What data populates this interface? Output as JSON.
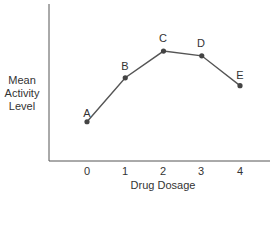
{
  "chart_data": {
    "type": "line",
    "title": "",
    "xlabel": "Drug Dosage",
    "ylabel": "Mean Activity Level",
    "ylabel_lines": [
      "Mean",
      "Activity",
      "Level"
    ],
    "x": [
      0,
      1,
      2,
      3,
      4
    ],
    "categories": [
      "0",
      "1",
      "2",
      "3",
      "4"
    ],
    "point_labels": [
      "A",
      "B",
      "C",
      "D",
      "E"
    ],
    "values": [
      2.5,
      5.3,
      7.0,
      6.7,
      4.8
    ],
    "ylim": [
      0,
      10
    ],
    "y_ticks_shown": false,
    "grid": false,
    "legend": null
  },
  "colors": {
    "line": "#555555",
    "marker": "#444444",
    "axis": "#555555",
    "text": "#333333"
  }
}
